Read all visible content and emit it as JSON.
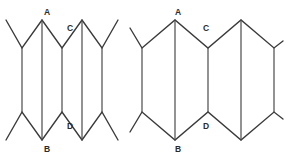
{
  "figure": {
    "stroke_color": "#3a3a3a",
    "crease_color": "#4a4a4a",
    "label_color": "#2b2b2b",
    "background_color": "#ffffff",
    "canvas": {
      "width": 285,
      "height": 158
    },
    "panels": [
      {
        "id": "left",
        "name": "compressed-accordion",
        "caption": "",
        "state": "compressed",
        "pleat_count": 4,
        "labels": [
          {
            "id": "A",
            "text": "A",
            "x": 47,
            "y": 13,
            "role": "top-peak"
          },
          {
            "id": "C",
            "text": "C",
            "x": 70,
            "y": 29,
            "role": "top-valley"
          },
          {
            "id": "B",
            "text": "B",
            "x": 47,
            "y": 148,
            "role": "bottom-valley"
          },
          {
            "id": "D",
            "text": "D",
            "x": 70,
            "y": 126,
            "role": "bottom-peak"
          }
        ],
        "top_peaks_x": [
          42,
          82
        ],
        "top_valleys_x": [
          22,
          62,
          102
        ],
        "vertical_lines_x": [
          22,
          42,
          62,
          82,
          102
        ],
        "top_peak_y": 20,
        "top_valley_y": 48,
        "bottom_valley_y": 140,
        "bottom_peak_y": 112,
        "outer_left_tip": {
          "x": 6,
          "y": 20
        },
        "outer_right_tip": {
          "x": 118,
          "y": 20
        },
        "outer_left_tip_bottom": {
          "x": 6,
          "y": 140
        },
        "outer_right_tip_bottom": {
          "x": 118,
          "y": 140
        }
      },
      {
        "id": "right",
        "name": "expanded-accordion",
        "caption": "",
        "state": "expanded",
        "pleat_count": 4,
        "labels": [
          {
            "id": "A",
            "text": "A",
            "x": 178,
            "y": 13,
            "role": "top-peak"
          },
          {
            "id": "C",
            "text": "C",
            "x": 205,
            "y": 29,
            "role": "top-valley"
          },
          {
            "id": "B",
            "text": "B",
            "x": 178,
            "y": 148,
            "role": "bottom-valley"
          },
          {
            "id": "D",
            "text": "D",
            "x": 205,
            "y": 126,
            "role": "bottom-peak"
          }
        ],
        "top_peaks_x": [
          175,
          241
        ],
        "top_valleys_x": [
          142,
          208,
          274
        ],
        "vertical_lines_x": [
          142,
          175,
          208,
          241,
          274
        ],
        "top_peak_y": 20,
        "top_valley_y": 48,
        "bottom_valley_y": 140,
        "bottom_peak_y": 112,
        "outer_left_tip": {
          "x": 142,
          "y": 48
        },
        "outer_right_tip": {
          "x": 280,
          "y": 20
        },
        "outer_left_tip_bottom": {
          "x": 142,
          "y": 112
        },
        "outer_right_tip_bottom": {
          "x": 280,
          "y": 140
        }
      }
    ]
  }
}
